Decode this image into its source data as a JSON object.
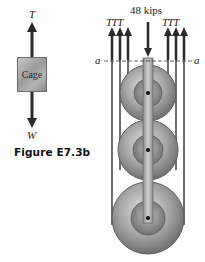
{
  "figure": {
    "caption": "Figure E7.3b",
    "free_body": {
      "box_label": "Cage",
      "top_force_label": "T",
      "bottom_force_label": "W"
    },
    "pulley_system": {
      "load_label": "48 kips",
      "left_tension_labels": "TTT",
      "right_tension_labels": "TTT",
      "section_left_label": "a",
      "section_right_label": "a",
      "pulley_count": 3
    }
  },
  "colors": {
    "arrow": "#2a2a2a",
    "metal_light": "#d8d8d8",
    "metal_dark": "#7a7a7a",
    "cable": "#6e6e6e"
  }
}
